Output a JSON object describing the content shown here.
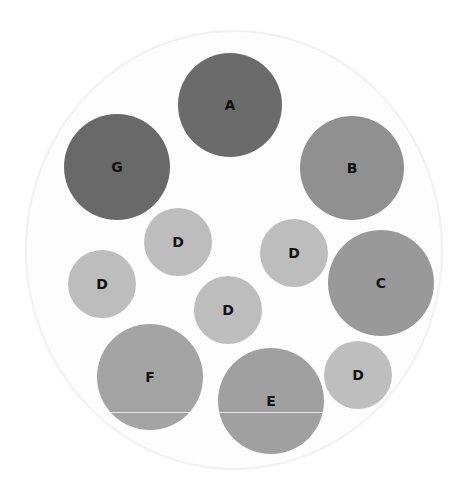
{
  "diagram": {
    "type": "bubble-packing",
    "container": {
      "cx": 234,
      "cy": 250,
      "rx": 209,
      "ry": 220,
      "fill": "#fdfdfd",
      "stroke": "#f1f1f1"
    },
    "bubbles": [
      {
        "label": "A",
        "cx": 230,
        "cy": 105,
        "r": 52,
        "color": "#6b6b6b"
      },
      {
        "label": "G",
        "cx": 117,
        "cy": 167,
        "r": 53,
        "color": "#696969"
      },
      {
        "label": "B",
        "cx": 352,
        "cy": 168,
        "r": 52,
        "color": "#909090"
      },
      {
        "label": "D",
        "cx": 178,
        "cy": 242,
        "r": 34,
        "color": "#bdbdbd"
      },
      {
        "label": "D",
        "cx": 294,
        "cy": 253,
        "r": 34,
        "color": "#bdbdbd"
      },
      {
        "label": "C",
        "cx": 381,
        "cy": 283,
        "r": 53,
        "color": "#999999"
      },
      {
        "label": "D",
        "cx": 102,
        "cy": 284,
        "r": 34,
        "color": "#bdbdbd"
      },
      {
        "label": "D",
        "cx": 228,
        "cy": 310,
        "r": 34,
        "color": "#bdbdbd"
      },
      {
        "label": "D",
        "cx": 358,
        "cy": 375,
        "r": 34,
        "color": "#bebebe"
      },
      {
        "label": "F",
        "cx": 150,
        "cy": 377,
        "r": 53,
        "color": "#a4a4a4"
      },
      {
        "label": "E",
        "cx": 271,
        "cy": 401,
        "r": 53,
        "color": "#a0a0a0"
      }
    ],
    "artifact_line": {
      "y": 412,
      "x1": 110,
      "x2": 323
    }
  }
}
